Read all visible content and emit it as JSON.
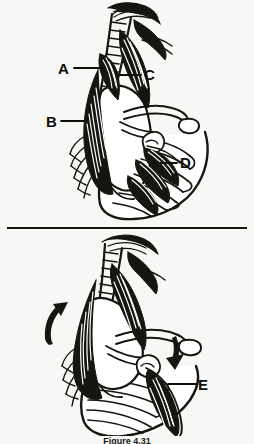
{
  "figure": {
    "caption": "Figure 4.31",
    "background_color": "#f7f7f5",
    "ink_color": "#17150f",
    "panels": [
      {
        "name": "upper-panel",
        "description": "Posterior view of shoulder girdle showing vertebral column, scapula, clavicle, rib cage and attached musculature",
        "labels": [
          {
            "id": "A",
            "text": "A",
            "x": 61,
            "y": 61,
            "leader": {
              "x1": 74,
              "y1": 68,
              "x2": 103,
              "y2": 68
            }
          },
          {
            "id": "C",
            "text": "C",
            "x": 144,
            "y": 67,
            "leader": {
              "x1": 117,
              "y1": 75,
              "x2": 141,
              "y2": 75
            }
          },
          {
            "id": "B",
            "text": "B",
            "x": 48,
            "y": 114,
            "leader": {
              "x1": 61,
              "y1": 121,
              "x2": 84,
              "y2": 121
            }
          },
          {
            "id": "D",
            "text": "D",
            "x": 180,
            "y": 155,
            "leader": {
              "x1": 152,
              "y1": 163,
              "x2": 177,
              "y2": 163
            }
          }
        ]
      },
      {
        "name": "lower-panel",
        "description": "Same shoulder girdle shown in elevated position with motion arrows indicating upward rotation of scapula",
        "labels": [
          {
            "id": "E",
            "text": "E",
            "x": 196,
            "y": 377,
            "leader": {
              "x1": 160,
              "y1": 384,
              "x2": 192,
              "y2": 384
            }
          }
        ],
        "arrows": [
          {
            "id": "arrow-up",
            "direction": "up",
            "x": 45,
            "y": 302
          },
          {
            "id": "arrow-down",
            "direction": "down",
            "x": 168,
            "y": 332
          }
        ]
      }
    ]
  }
}
